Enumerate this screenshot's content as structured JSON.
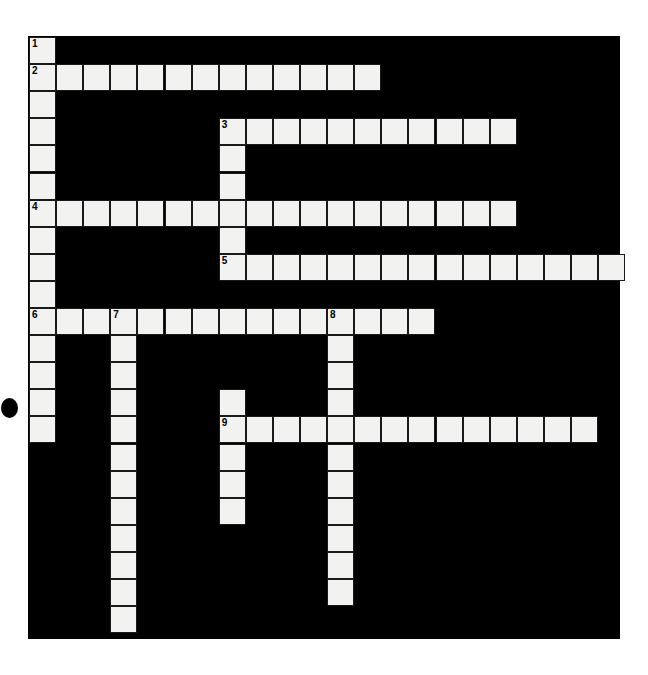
{
  "puzzle": {
    "title": "Crossword Puzzle Grid",
    "kind": "crossword-grid",
    "grid": {
      "origin_x": 29,
      "origin_y": 37,
      "cell": 27.1,
      "cols": 22,
      "rows": 22,
      "board": {
        "x": 28,
        "y": 36,
        "width": 592,
        "height": 603
      },
      "background_color": "#000000",
      "cell_color": "#f2f2f0",
      "cell_border_color": "#1a1a1a",
      "number_color": "#000000"
    },
    "artifact": {
      "x": 1,
      "y": 398,
      "width": 17,
      "height": 20,
      "color": "#000000"
    },
    "entries": [
      {
        "number": "1",
        "direction": "down",
        "col": 0,
        "row": 0,
        "length": 16
      },
      {
        "number": "2",
        "direction": "across",
        "col": 0,
        "row": 1,
        "length": 13
      },
      {
        "number": "3",
        "direction": "across",
        "col": 7,
        "row": 3,
        "length": 11
      },
      {
        "number": "3",
        "direction": "down",
        "col": 7,
        "row": 3,
        "length": 6
      },
      {
        "number": "4",
        "direction": "across",
        "col": 0,
        "row": 6,
        "length": 18
      },
      {
        "number": "5",
        "direction": "across",
        "col": 7,
        "row": 8,
        "length": 15
      },
      {
        "number": "6",
        "direction": "across",
        "col": 0,
        "row": 10,
        "length": 14
      },
      {
        "number": "7",
        "direction": "down",
        "col": 3,
        "row": 10,
        "length": 12
      },
      {
        "number": "8",
        "direction": "down",
        "col": 11,
        "row": 10,
        "length": 11
      },
      {
        "number": "9",
        "direction": "across",
        "col": 7,
        "row": 14,
        "length": 14
      },
      {
        "number": "9",
        "direction": "down",
        "col": 7,
        "row": 14,
        "length": 5
      }
    ],
    "cells": [
      {
        "col": 0,
        "row": 0,
        "number": "1"
      },
      {
        "col": 0,
        "row": 1,
        "number": "2"
      },
      {
        "col": 1,
        "row": 1,
        "number": ""
      },
      {
        "col": 2,
        "row": 1,
        "number": ""
      },
      {
        "col": 3,
        "row": 1,
        "number": ""
      },
      {
        "col": 4,
        "row": 1,
        "number": ""
      },
      {
        "col": 5,
        "row": 1,
        "number": ""
      },
      {
        "col": 6,
        "row": 1,
        "number": ""
      },
      {
        "col": 7,
        "row": 1,
        "number": ""
      },
      {
        "col": 8,
        "row": 1,
        "number": ""
      },
      {
        "col": 9,
        "row": 1,
        "number": ""
      },
      {
        "col": 10,
        "row": 1,
        "number": ""
      },
      {
        "col": 11,
        "row": 1,
        "number": ""
      },
      {
        "col": 12,
        "row": 1,
        "number": ""
      },
      {
        "col": 0,
        "row": 2,
        "number": ""
      },
      {
        "col": 0,
        "row": 3,
        "number": ""
      },
      {
        "col": 7,
        "row": 3,
        "number": "3"
      },
      {
        "col": 8,
        "row": 3,
        "number": ""
      },
      {
        "col": 9,
        "row": 3,
        "number": ""
      },
      {
        "col": 10,
        "row": 3,
        "number": ""
      },
      {
        "col": 11,
        "row": 3,
        "number": ""
      },
      {
        "col": 12,
        "row": 3,
        "number": ""
      },
      {
        "col": 13,
        "row": 3,
        "number": ""
      },
      {
        "col": 14,
        "row": 3,
        "number": ""
      },
      {
        "col": 15,
        "row": 3,
        "number": ""
      },
      {
        "col": 16,
        "row": 3,
        "number": ""
      },
      {
        "col": 17,
        "row": 3,
        "number": ""
      },
      {
        "col": 0,
        "row": 4,
        "number": ""
      },
      {
        "col": 7,
        "row": 4,
        "number": ""
      },
      {
        "col": 0,
        "row": 5,
        "number": ""
      },
      {
        "col": 7,
        "row": 5,
        "number": ""
      },
      {
        "col": 0,
        "row": 6,
        "number": "4"
      },
      {
        "col": 1,
        "row": 6,
        "number": ""
      },
      {
        "col": 2,
        "row": 6,
        "number": ""
      },
      {
        "col": 3,
        "row": 6,
        "number": ""
      },
      {
        "col": 4,
        "row": 6,
        "number": ""
      },
      {
        "col": 5,
        "row": 6,
        "number": ""
      },
      {
        "col": 6,
        "row": 6,
        "number": ""
      },
      {
        "col": 7,
        "row": 6,
        "number": ""
      },
      {
        "col": 8,
        "row": 6,
        "number": ""
      },
      {
        "col": 9,
        "row": 6,
        "number": ""
      },
      {
        "col": 10,
        "row": 6,
        "number": ""
      },
      {
        "col": 11,
        "row": 6,
        "number": ""
      },
      {
        "col": 12,
        "row": 6,
        "number": ""
      },
      {
        "col": 13,
        "row": 6,
        "number": ""
      },
      {
        "col": 14,
        "row": 6,
        "number": ""
      },
      {
        "col": 15,
        "row": 6,
        "number": ""
      },
      {
        "col": 16,
        "row": 6,
        "number": ""
      },
      {
        "col": 17,
        "row": 6,
        "number": ""
      },
      {
        "col": 0,
        "row": 7,
        "number": ""
      },
      {
        "col": 7,
        "row": 7,
        "number": ""
      },
      {
        "col": 0,
        "row": 8,
        "number": ""
      },
      {
        "col": 7,
        "row": 8,
        "number": "5"
      },
      {
        "col": 8,
        "row": 8,
        "number": ""
      },
      {
        "col": 9,
        "row": 8,
        "number": ""
      },
      {
        "col": 10,
        "row": 8,
        "number": ""
      },
      {
        "col": 11,
        "row": 8,
        "number": ""
      },
      {
        "col": 12,
        "row": 8,
        "number": ""
      },
      {
        "col": 13,
        "row": 8,
        "number": ""
      },
      {
        "col": 14,
        "row": 8,
        "number": ""
      },
      {
        "col": 15,
        "row": 8,
        "number": ""
      },
      {
        "col": 16,
        "row": 8,
        "number": ""
      },
      {
        "col": 17,
        "row": 8,
        "number": ""
      },
      {
        "col": 18,
        "row": 8,
        "number": ""
      },
      {
        "col": 19,
        "row": 8,
        "number": ""
      },
      {
        "col": 20,
        "row": 8,
        "number": ""
      },
      {
        "col": 21,
        "row": 8,
        "number": ""
      },
      {
        "col": 0,
        "row": 9,
        "number": ""
      },
      {
        "col": 0,
        "row": 10,
        "number": "6"
      },
      {
        "col": 1,
        "row": 10,
        "number": ""
      },
      {
        "col": 2,
        "row": 10,
        "number": ""
      },
      {
        "col": 3,
        "row": 10,
        "number": "7"
      },
      {
        "col": 4,
        "row": 10,
        "number": ""
      },
      {
        "col": 5,
        "row": 10,
        "number": ""
      },
      {
        "col": 6,
        "row": 10,
        "number": ""
      },
      {
        "col": 7,
        "row": 10,
        "number": ""
      },
      {
        "col": 8,
        "row": 10,
        "number": ""
      },
      {
        "col": 9,
        "row": 10,
        "number": ""
      },
      {
        "col": 10,
        "row": 10,
        "number": ""
      },
      {
        "col": 11,
        "row": 10,
        "number": "8"
      },
      {
        "col": 12,
        "row": 10,
        "number": ""
      },
      {
        "col": 13,
        "row": 10,
        "number": ""
      },
      {
        "col": 14,
        "row": 10,
        "number": ""
      },
      {
        "col": 0,
        "row": 11,
        "number": ""
      },
      {
        "col": 3,
        "row": 11,
        "number": ""
      },
      {
        "col": 11,
        "row": 11,
        "number": ""
      },
      {
        "col": 0,
        "row": 12,
        "number": ""
      },
      {
        "col": 3,
        "row": 12,
        "number": ""
      },
      {
        "col": 11,
        "row": 12,
        "number": ""
      },
      {
        "col": 0,
        "row": 13,
        "number": ""
      },
      {
        "col": 3,
        "row": 13,
        "number": ""
      },
      {
        "col": 7,
        "row": 13,
        "number": ""
      },
      {
        "col": 11,
        "row": 13,
        "number": ""
      },
      {
        "col": 0,
        "row": 14,
        "number": ""
      },
      {
        "col": 3,
        "row": 14,
        "number": ""
      },
      {
        "col": 7,
        "row": 14,
        "number": "9"
      },
      {
        "col": 8,
        "row": 14,
        "number": ""
      },
      {
        "col": 9,
        "row": 14,
        "number": ""
      },
      {
        "col": 10,
        "row": 14,
        "number": ""
      },
      {
        "col": 11,
        "row": 14,
        "number": ""
      },
      {
        "col": 12,
        "row": 14,
        "number": ""
      },
      {
        "col": 13,
        "row": 14,
        "number": ""
      },
      {
        "col": 14,
        "row": 14,
        "number": ""
      },
      {
        "col": 15,
        "row": 14,
        "number": ""
      },
      {
        "col": 16,
        "row": 14,
        "number": ""
      },
      {
        "col": 17,
        "row": 14,
        "number": ""
      },
      {
        "col": 18,
        "row": 14,
        "number": ""
      },
      {
        "col": 19,
        "row": 14,
        "number": ""
      },
      {
        "col": 20,
        "row": 14,
        "number": ""
      },
      {
        "col": 3,
        "row": 15,
        "number": ""
      },
      {
        "col": 7,
        "row": 15,
        "number": ""
      },
      {
        "col": 11,
        "row": 15,
        "number": ""
      },
      {
        "col": 3,
        "row": 16,
        "number": ""
      },
      {
        "col": 7,
        "row": 16,
        "number": ""
      },
      {
        "col": 11,
        "row": 16,
        "number": ""
      },
      {
        "col": 3,
        "row": 17,
        "number": ""
      },
      {
        "col": 7,
        "row": 17,
        "number": ""
      },
      {
        "col": 11,
        "row": 17,
        "number": ""
      },
      {
        "col": 3,
        "row": 18,
        "number": ""
      },
      {
        "col": 11,
        "row": 18,
        "number": ""
      },
      {
        "col": 3,
        "row": 19,
        "number": ""
      },
      {
        "col": 11,
        "row": 19,
        "number": ""
      },
      {
        "col": 3,
        "row": 20,
        "number": ""
      },
      {
        "col": 11,
        "row": 20,
        "number": ""
      },
      {
        "col": 3,
        "row": 21,
        "number": ""
      }
    ]
  }
}
